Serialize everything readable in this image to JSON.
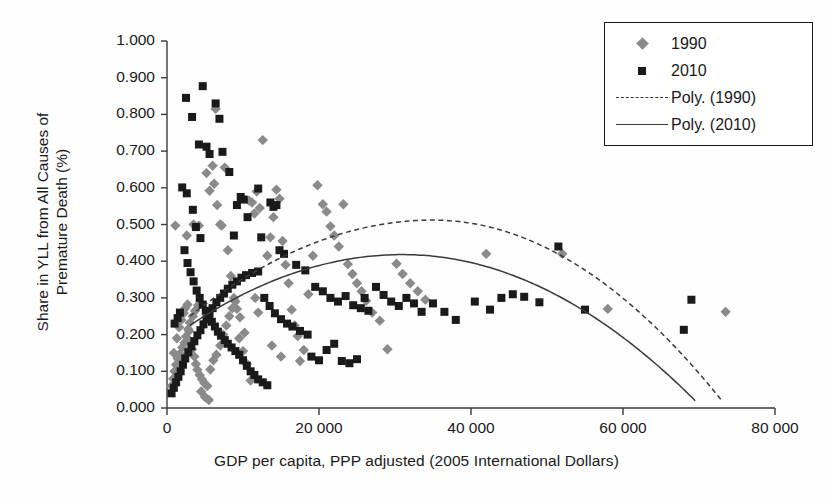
{
  "chart_data": {
    "type": "scatter",
    "title": "",
    "xlabel": "GDP per capita, PPP adjusted (2005 International Dollars)",
    "ylabel_line1": "Share in YLL from All Causes of",
    "ylabel_line2": "Premature Death (%)",
    "xlim": [
      0,
      80000
    ],
    "ylim": [
      0,
      1.0
    ],
    "xticks": [
      0,
      20000,
      40000,
      60000,
      80000
    ],
    "xticklabels": [
      "0",
      "20 000",
      "40 000",
      "60 000",
      "80 000"
    ],
    "yticks": [
      0.0,
      0.1,
      0.2,
      0.3,
      0.4,
      0.5,
      0.6,
      0.7,
      0.8,
      0.9,
      1.0
    ],
    "yticklabels": [
      "0.000",
      "0.100",
      "0.200",
      "0.300",
      "0.400",
      "0.500",
      "0.600",
      "0.700",
      "0.800",
      "0.900",
      "1.000"
    ],
    "grid": false,
    "legend_position": "top-right",
    "legend": [
      {
        "label": "1990",
        "marker": "diamond",
        "color": "#8a8a8a"
      },
      {
        "label": "2010",
        "marker": "square",
        "color": "#1a1a1a"
      },
      {
        "label": "Poly. (1990)",
        "marker": "dashed-line",
        "color": "#3a3a3a"
      },
      {
        "label": "Poly. (2010)",
        "marker": "solid-line",
        "color": "#3a3a3a"
      }
    ],
    "series": [
      {
        "name": "1990",
        "marker": "diamond",
        "color": "#8a8a8a",
        "points": [
          [
            1100,
            0.497
          ],
          [
            2600,
            0.47
          ],
          [
            3500,
            0.5
          ],
          [
            4200,
            0.497
          ],
          [
            5200,
            0.64
          ],
          [
            5600,
            0.592
          ],
          [
            6000,
            0.66
          ],
          [
            6200,
            0.611
          ],
          [
            6400,
            0.815
          ],
          [
            6600,
            0.553
          ],
          [
            7000,
            0.5
          ],
          [
            7200,
            0.497
          ],
          [
            7600,
            0.655
          ],
          [
            8000,
            0.43
          ],
          [
            8400,
            0.36
          ],
          [
            8800,
            0.3
          ],
          [
            9200,
            0.27
          ],
          [
            9600,
            0.247
          ],
          [
            10200,
            0.205
          ],
          [
            10800,
            0.565
          ],
          [
            11200,
            0.56
          ],
          [
            11500,
            0.53
          ],
          [
            11800,
            0.59
          ],
          [
            12200,
            0.545
          ],
          [
            12600,
            0.73
          ],
          [
            13200,
            0.415
          ],
          [
            13600,
            0.465
          ],
          [
            14000,
            0.52
          ],
          [
            14400,
            0.595
          ],
          [
            14800,
            0.57
          ],
          [
            15200,
            0.455
          ],
          [
            15600,
            0.39
          ],
          [
            16000,
            0.34
          ],
          [
            16400,
            0.268
          ],
          [
            16800,
            0.225
          ],
          [
            17200,
            0.196
          ],
          [
            18000,
            0.158
          ],
          [
            18600,
            0.31
          ],
          [
            19200,
            0.415
          ],
          [
            19800,
            0.607
          ],
          [
            20500,
            0.555
          ],
          [
            21000,
            0.535
          ],
          [
            21500,
            0.495
          ],
          [
            22000,
            0.47
          ],
          [
            22600,
            0.44
          ],
          [
            23200,
            0.555
          ],
          [
            23800,
            0.392
          ],
          [
            24400,
            0.365
          ],
          [
            25000,
            0.34
          ],
          [
            25600,
            0.318
          ],
          [
            26200,
            0.292
          ],
          [
            27000,
            0.26
          ],
          [
            28000,
            0.238
          ],
          [
            29000,
            0.16
          ],
          [
            30200,
            0.393
          ],
          [
            31000,
            0.365
          ],
          [
            32000,
            0.34
          ],
          [
            33000,
            0.318
          ],
          [
            34000,
            0.295
          ],
          [
            42000,
            0.42
          ],
          [
            52000,
            0.42
          ],
          [
            58000,
            0.27
          ],
          [
            73500,
            0.262
          ],
          [
            900,
            0.15
          ],
          [
            1300,
            0.19
          ],
          [
            1600,
            0.22
          ],
          [
            1900,
            0.24
          ],
          [
            2200,
            0.258
          ],
          [
            2400,
            0.272
          ],
          [
            2700,
            0.282
          ],
          [
            2900,
            0.21
          ],
          [
            3100,
            0.18
          ],
          [
            3300,
            0.16
          ],
          [
            3600,
            0.14
          ],
          [
            3800,
            0.12
          ],
          [
            4000,
            0.104
          ],
          [
            4300,
            0.09
          ],
          [
            4600,
            0.078
          ],
          [
            4900,
            0.068
          ],
          [
            5300,
            0.06
          ],
          [
            5700,
            0.105
          ],
          [
            6100,
            0.13
          ],
          [
            6500,
            0.145
          ],
          [
            7000,
            0.17
          ],
          [
            7400,
            0.2
          ],
          [
            7800,
            0.225
          ],
          [
            8200,
            0.25
          ],
          [
            8600,
            0.272
          ],
          [
            9000,
            0.29
          ],
          [
            9500,
            0.19
          ],
          [
            10000,
            0.155
          ],
          [
            10500,
            0.12
          ],
          [
            11000,
            0.075
          ],
          [
            11600,
            0.3
          ],
          [
            12000,
            0.26
          ],
          [
            600,
            0.06
          ],
          [
            800,
            0.08
          ],
          [
            1000,
            0.1
          ],
          [
            1200,
            0.118
          ],
          [
            1400,
            0.135
          ],
          [
            1700,
            0.148
          ],
          [
            2000,
            0.165
          ],
          [
            2300,
            0.178
          ],
          [
            2500,
            0.195
          ],
          [
            2800,
            0.215
          ],
          [
            3000,
            0.232
          ],
          [
            3400,
            0.25
          ],
          [
            3700,
            0.265
          ],
          [
            4100,
            0.28
          ],
          [
            4500,
            0.045
          ],
          [
            5000,
            0.03
          ],
          [
            5500,
            0.022
          ],
          [
            13800,
            0.17
          ],
          [
            15000,
            0.14
          ],
          [
            17500,
            0.128
          ]
        ]
      },
      {
        "name": "2010",
        "marker": "square",
        "color": "#1a1a1a",
        "points": [
          [
            2500,
            0.845
          ],
          [
            3300,
            0.793
          ],
          [
            4700,
            0.877
          ],
          [
            4200,
            0.718
          ],
          [
            5200,
            0.712
          ],
          [
            5600,
            0.692
          ],
          [
            6400,
            0.83
          ],
          [
            6900,
            0.788
          ],
          [
            7300,
            0.698
          ],
          [
            8200,
            0.643
          ],
          [
            2000,
            0.601
          ],
          [
            2600,
            0.585
          ],
          [
            3400,
            0.54
          ],
          [
            3800,
            0.493
          ],
          [
            4400,
            0.463
          ],
          [
            9200,
            0.553
          ],
          [
            9700,
            0.575
          ],
          [
            10100,
            0.568
          ],
          [
            10600,
            0.52
          ],
          [
            12000,
            0.598
          ],
          [
            13600,
            0.56
          ],
          [
            14000,
            0.548
          ],
          [
            14400,
            0.553
          ],
          [
            2300,
            0.43
          ],
          [
            2700,
            0.395
          ],
          [
            3100,
            0.37
          ],
          [
            3500,
            0.345
          ],
          [
            3900,
            0.32
          ],
          [
            4300,
            0.3
          ],
          [
            4700,
            0.282
          ],
          [
            5100,
            0.265
          ],
          [
            5500,
            0.25
          ],
          [
            5900,
            0.235
          ],
          [
            6300,
            0.222
          ],
          [
            6700,
            0.208
          ],
          [
            7100,
            0.197
          ],
          [
            7600,
            0.185
          ],
          [
            8000,
            0.175
          ],
          [
            8500,
            0.165
          ],
          [
            9000,
            0.155
          ],
          [
            9500,
            0.145
          ],
          [
            10000,
            0.13
          ],
          [
            10500,
            0.115
          ],
          [
            11000,
            0.1
          ],
          [
            11500,
            0.09
          ],
          [
            12000,
            0.078
          ],
          [
            12600,
            0.07
          ],
          [
            13200,
            0.062
          ],
          [
            600,
            0.04
          ],
          [
            900,
            0.055
          ],
          [
            1200,
            0.07
          ],
          [
            1500,
            0.085
          ],
          [
            1800,
            0.1
          ],
          [
            2100,
            0.118
          ],
          [
            2400,
            0.135
          ],
          [
            2800,
            0.152
          ],
          [
            3200,
            0.168
          ],
          [
            3600,
            0.182
          ],
          [
            4000,
            0.198
          ],
          [
            4400,
            0.212
          ],
          [
            4800,
            0.228
          ],
          [
            5200,
            0.242
          ],
          [
            5600,
            0.258
          ],
          [
            6000,
            0.272
          ],
          [
            6500,
            0.288
          ],
          [
            7000,
            0.3
          ],
          [
            7500,
            0.312
          ],
          [
            8000,
            0.325
          ],
          [
            8600,
            0.336
          ],
          [
            9200,
            0.345
          ],
          [
            9800,
            0.355
          ],
          [
            10400,
            0.362
          ],
          [
            11200,
            0.368
          ],
          [
            12000,
            0.372
          ],
          [
            12800,
            0.3
          ],
          [
            13500,
            0.278
          ],
          [
            14200,
            0.258
          ],
          [
            15000,
            0.242
          ],
          [
            15800,
            0.23
          ],
          [
            16500,
            0.222
          ],
          [
            17500,
            0.21
          ],
          [
            18500,
            0.2
          ],
          [
            19500,
            0.33
          ],
          [
            20500,
            0.318
          ],
          [
            21500,
            0.3
          ],
          [
            22500,
            0.29
          ],
          [
            23500,
            0.305
          ],
          [
            24500,
            0.28
          ],
          [
            25500,
            0.272
          ],
          [
            26500,
            0.265
          ],
          [
            27500,
            0.33
          ],
          [
            28500,
            0.308
          ],
          [
            29500,
            0.29
          ],
          [
            30500,
            0.278
          ],
          [
            31500,
            0.3
          ],
          [
            32500,
            0.285
          ],
          [
            33500,
            0.262
          ],
          [
            35000,
            0.285
          ],
          [
            36500,
            0.262
          ],
          [
            38000,
            0.24
          ],
          [
            40500,
            0.29
          ],
          [
            42500,
            0.268
          ],
          [
            44000,
            0.3
          ],
          [
            45500,
            0.31
          ],
          [
            47000,
            0.303
          ],
          [
            49000,
            0.288
          ],
          [
            51500,
            0.44
          ],
          [
            55000,
            0.268
          ],
          [
            69000,
            0.295
          ],
          [
            68000,
            0.213
          ],
          [
            17000,
            0.39
          ],
          [
            18200,
            0.375
          ],
          [
            19000,
            0.14
          ],
          [
            20000,
            0.13
          ],
          [
            21000,
            0.158
          ],
          [
            22000,
            0.175
          ],
          [
            23000,
            0.128
          ],
          [
            24000,
            0.122
          ],
          [
            25000,
            0.133
          ],
          [
            26000,
            0.3
          ],
          [
            8800,
            0.47
          ],
          [
            12400,
            0.465
          ],
          [
            14800,
            0.43
          ],
          [
            15400,
            0.42
          ],
          [
            1000,
            0.23
          ],
          [
            1400,
            0.245
          ],
          [
            1700,
            0.26
          ]
        ]
      }
    ],
    "trendlines": [
      {
        "name": "Poly. (1990)",
        "style": "dashed",
        "color": "#3a3a3a",
        "peak_x": 35000,
        "peak_y": 0.512,
        "x_start": 3000,
        "x_end": 73000,
        "y_start": 0.25,
        "y_end": 0.02
      },
      {
        "name": "Poly. (2010)",
        "style": "solid",
        "color": "#3a3a3a",
        "peak_x": 31000,
        "peak_y": 0.418,
        "x_start": 3000,
        "x_end": 69500,
        "y_start": 0.225,
        "y_end": 0.02
      }
    ]
  }
}
